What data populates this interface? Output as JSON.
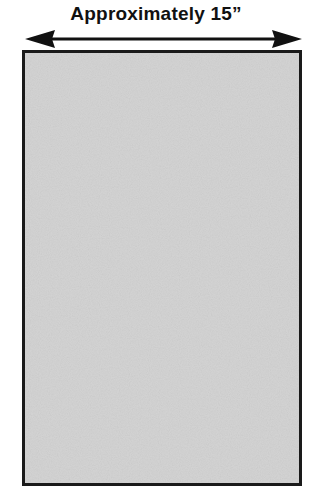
{
  "diagram": {
    "dimension_label": "Approximately 15”",
    "arrow": {
      "type": "double-headed",
      "orientation": "horizontal"
    },
    "panel": {
      "shape": "rectangle",
      "fill": "speckled-gray-texture",
      "fill_color": "#c9c9c9",
      "border_color": "#1a1a1a"
    }
  }
}
